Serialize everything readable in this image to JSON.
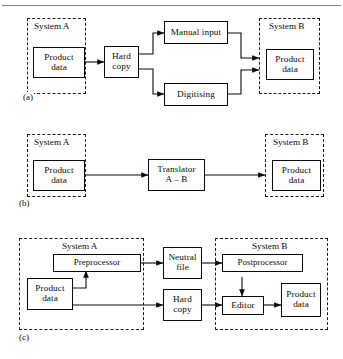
{
  "figure": {
    "type": "flow-diagram",
    "panels": [
      {
        "id": "a",
        "label": "(a)",
        "caption": "Hard copy route with manual input and digitising",
        "groups": [
          {
            "name": "system-a",
            "label": "System A"
          },
          {
            "name": "system-b",
            "label": "System B"
          }
        ],
        "nodes": [
          {
            "id": "a-product-data-src",
            "label": "Product data",
            "line1": "Product",
            "line2": "data",
            "group": "system-a"
          },
          {
            "id": "a-hard-copy",
            "label": "Hard copy",
            "line1": "Hard",
            "line2": "copy",
            "group": "none"
          },
          {
            "id": "a-manual-input",
            "label": "Manual input",
            "line1": "Manual input",
            "line2": "",
            "group": "none"
          },
          {
            "id": "a-digitising",
            "label": "Digitising",
            "line1": "Digitising",
            "line2": "",
            "group": "none"
          },
          {
            "id": "a-product-data-dst",
            "label": "Product data",
            "line1": "Product",
            "line2": "data",
            "group": "system-b"
          }
        ],
        "edges": [
          {
            "from": "a-product-data-src",
            "to": "a-hard-copy"
          },
          {
            "from": "a-hard-copy",
            "to": "a-manual-input"
          },
          {
            "from": "a-hard-copy",
            "to": "a-digitising"
          },
          {
            "from": "a-manual-input",
            "to": "a-product-data-dst"
          },
          {
            "from": "a-digitising",
            "to": "a-product-data-dst"
          }
        ]
      },
      {
        "id": "b",
        "label": "(b)",
        "caption": "Direct translator route",
        "groups": [
          {
            "name": "system-a",
            "label": "System A"
          },
          {
            "name": "system-b",
            "label": "System B"
          }
        ],
        "nodes": [
          {
            "id": "b-product-data-src",
            "label": "Product data",
            "line1": "Product",
            "line2": "data",
            "group": "system-a"
          },
          {
            "id": "b-translator",
            "label": "Translator A - B",
            "line1": "Translator",
            "line2": "A – B",
            "group": "none"
          },
          {
            "id": "b-product-data-dst",
            "label": "Product data",
            "line1": "Product",
            "line2": "data",
            "group": "system-b"
          }
        ],
        "edges": [
          {
            "from": "b-product-data-src",
            "to": "b-translator"
          },
          {
            "from": "b-translator",
            "to": "b-product-data-dst"
          }
        ]
      },
      {
        "id": "c",
        "label": "(c)",
        "caption": "Neutral file route with pre- and postprocessor plus editor",
        "groups": [
          {
            "name": "system-a",
            "label": "System A"
          },
          {
            "name": "system-b",
            "label": "System B"
          }
        ],
        "nodes": [
          {
            "id": "c-preprocessor",
            "label": "Preprocessor",
            "line1": "Preprocessor",
            "line2": "",
            "group": "system-a"
          },
          {
            "id": "c-product-data-src",
            "label": "Product data",
            "line1": "Product",
            "line2": "data",
            "group": "system-a"
          },
          {
            "id": "c-neutral-file",
            "label": "Neutral file",
            "line1": "Neutral",
            "line2": "file",
            "group": "none"
          },
          {
            "id": "c-hard-copy",
            "label": "Hard copy",
            "line1": "Hard",
            "line2": "copy",
            "group": "none"
          },
          {
            "id": "c-postprocessor",
            "label": "Postprocessor",
            "line1": "Postprocessor",
            "line2": "",
            "group": "system-b"
          },
          {
            "id": "c-editor",
            "label": "Editor",
            "line1": "Editor",
            "line2": "",
            "group": "system-b"
          },
          {
            "id": "c-product-data-dst",
            "label": "Product data",
            "line1": "Product",
            "line2": "data",
            "group": "system-b"
          }
        ],
        "edges": [
          {
            "from": "c-product-data-src",
            "to": "c-preprocessor"
          },
          {
            "from": "c-preprocessor",
            "to": "c-neutral-file"
          },
          {
            "from": "c-neutral-file",
            "to": "c-postprocessor"
          },
          {
            "from": "c-product-data-src",
            "to": "c-hard-copy"
          },
          {
            "from": "c-hard-copy",
            "to": "c-editor"
          },
          {
            "from": "c-postprocessor",
            "to": "c-editor"
          },
          {
            "from": "c-editor",
            "to": "c-product-data-dst"
          }
        ]
      }
    ],
    "colors": {
      "background": "#ffffff",
      "stroke": "#0a0a0a",
      "dashed_stroke": "#1a1a1a",
      "rule": "#6b6b6b"
    }
  }
}
